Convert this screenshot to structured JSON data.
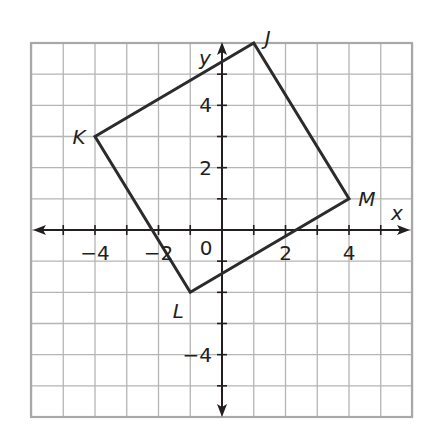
{
  "figure": {
    "type": "coordinate-plane",
    "grid": {
      "x_min": -6,
      "x_max": 6,
      "y_min": -6,
      "y_max": 6,
      "step": 1,
      "color": "#b5b5b5",
      "border_color": "#a8a8a8"
    },
    "axes": {
      "x_label": "x",
      "y_label": "y",
      "color": "#231f20",
      "x_tick_labels": [
        {
          "value": -4,
          "text": "−4"
        },
        {
          "value": -2,
          "text": "−2"
        },
        {
          "value": 2,
          "text": "2"
        },
        {
          "value": 4,
          "text": "4"
        }
      ],
      "y_tick_labels": [
        {
          "value": 4,
          "text": "4"
        },
        {
          "value": 2,
          "text": "2"
        },
        {
          "value": -4,
          "text": "−4"
        }
      ],
      "origin_label": "0"
    },
    "polygon": {
      "name": "JKLM",
      "stroke": "#2b2b2b",
      "vertices": [
        {
          "label": "J",
          "x": 1,
          "y": 6
        },
        {
          "label": "M",
          "x": 4,
          "y": 1
        },
        {
          "label": "L",
          "x": -1,
          "y": -2
        },
        {
          "label": "K",
          "x": -4,
          "y": 3
        }
      ]
    }
  }
}
